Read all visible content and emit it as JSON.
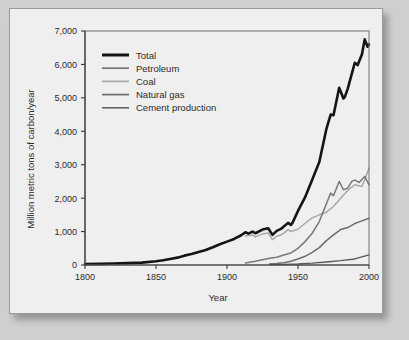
{
  "figure": {
    "background_color": "#efefef",
    "page_background": "#cfcfcf",
    "border_color": "#9a9a9a"
  },
  "chart_data": {
    "type": "line",
    "title": "",
    "xlabel": "Year",
    "ylabel": "Million metric tons of carbon/year",
    "xlim": [
      1800,
      2000
    ],
    "ylim": [
      0,
      7000
    ],
    "xticks": [
      1800,
      1850,
      1900,
      1950,
      2000
    ],
    "xtick_labels": [
      "1800",
      "1850",
      "1900",
      "1950",
      "2000"
    ],
    "yticks": [
      0,
      1000,
      2000,
      3000,
      4000,
      5000,
      6000,
      7000
    ],
    "ytick_labels": [
      "0",
      "1,000",
      "2,000",
      "3,000",
      "4,000",
      "5,000",
      "6,000",
      "7,000"
    ],
    "grid": false,
    "legend_position": "upper-left",
    "series": [
      {
        "name": "Total",
        "color": "#141414",
        "width": 2.6,
        "x": [
          1800,
          1810,
          1820,
          1830,
          1840,
          1850,
          1855,
          1860,
          1865,
          1870,
          1875,
          1880,
          1885,
          1890,
          1895,
          1900,
          1905,
          1910,
          1913,
          1915,
          1918,
          1920,
          1925,
          1929,
          1932,
          1935,
          1938,
          1940,
          1943,
          1945,
          1946,
          1950,
          1955,
          1960,
          1965,
          1970,
          1973,
          1975,
          1979,
          1980,
          1982,
          1983,
          1985,
          1988,
          1990,
          1992,
          1995,
          1997,
          1999,
          2000
        ],
        "y": [
          30,
          35,
          45,
          55,
          70,
          110,
          140,
          180,
          220,
          280,
          330,
          390,
          450,
          530,
          620,
          700,
          780,
          890,
          980,
          940,
          1000,
          950,
          1060,
          1100,
          900,
          1020,
          1080,
          1150,
          1260,
          1200,
          1250,
          1620,
          2030,
          2550,
          3080,
          4070,
          4500,
          4480,
          5300,
          5200,
          4980,
          5030,
          5270,
          5740,
          6050,
          5980,
          6300,
          6750,
          6530,
          6600
        ]
      },
      {
        "name": "Petroleum",
        "color": "#777777",
        "width": 1.5,
        "x": [
          1913,
          1920,
          1925,
          1930,
          1935,
          1940,
          1945,
          1950,
          1955,
          1960,
          1965,
          1970,
          1973,
          1975,
          1979,
          1980,
          1982,
          1985,
          1988,
          1990,
          1993,
          1995,
          1997,
          2000
        ],
        "y": [
          60,
          110,
          160,
          200,
          230,
          300,
          360,
          500,
          700,
          950,
          1300,
          1830,
          2150,
          2070,
          2500,
          2420,
          2250,
          2300,
          2510,
          2540,
          2470,
          2560,
          2650,
          2400
        ]
      },
      {
        "name": "Coal",
        "color": "#a8a8a8",
        "width": 1.5,
        "x": [
          1913,
          1918,
          1920,
          1925,
          1929,
          1932,
          1935,
          1938,
          1940,
          1943,
          1945,
          1950,
          1955,
          1960,
          1965,
          1970,
          1975,
          1980,
          1985,
          1990,
          1995,
          1997,
          2000
        ],
        "y": [
          870,
          900,
          840,
          930,
          960,
          760,
          860,
          900,
          950,
          1060,
          1000,
          1070,
          1250,
          1410,
          1500,
          1580,
          1750,
          2000,
          2230,
          2400,
          2350,
          2550,
          2900
        ]
      },
      {
        "name": "Natural gas",
        "color": "#6d6d6d",
        "width": 1.5,
        "x": [
          1930,
          1935,
          1940,
          1945,
          1950,
          1955,
          1960,
          1965,
          1970,
          1975,
          1980,
          1985,
          1990,
          1995,
          2000
        ],
        "y": [
          30,
          45,
          70,
          110,
          180,
          260,
          380,
          520,
          730,
          900,
          1060,
          1120,
          1240,
          1320,
          1400
        ]
      },
      {
        "name": "Cement production",
        "color": "#5a5a5a",
        "width": 1.3,
        "x": [
          1930,
          1940,
          1950,
          1960,
          1970,
          1980,
          1990,
          2000
        ],
        "y": [
          15,
          20,
          30,
          55,
          90,
          130,
          180,
          300
        ]
      }
    ]
  },
  "legend": {
    "entries": [
      {
        "label": "Total"
      },
      {
        "label": "Petroleum"
      },
      {
        "label": "Coal"
      },
      {
        "label": "Natural gas"
      },
      {
        "label": "Cement production"
      }
    ]
  }
}
